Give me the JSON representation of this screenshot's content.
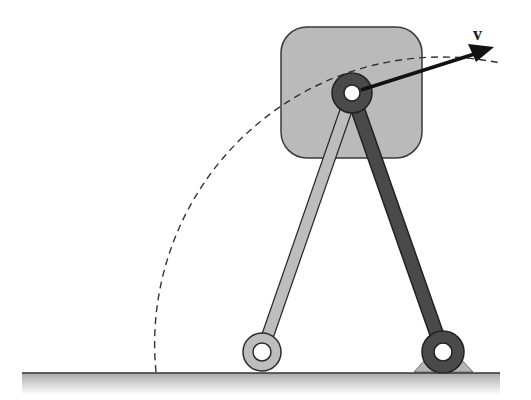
{
  "diagram": {
    "type": "four-bar linkage with coupler block",
    "labels": {
      "velocity": "v"
    },
    "colors": {
      "block_fill": "#b8b8b8",
      "block_stroke": "#3a3a3a",
      "light_link_fill": "#bdbdbd",
      "dark_link_fill": "#4a4a4a",
      "outline": "#2a2a2a",
      "ground_line": "#333333",
      "ground_shade_top": "#b0b0b0",
      "ground_shade_bottom": "#ffffff",
      "support_fill": "#b5b5b5",
      "dashed_path": "#333333",
      "arrow": "#111111"
    },
    "elements": {
      "block": {
        "x": 281,
        "y": 27,
        "width": 141,
        "height": 131,
        "corner_radius": 26
      },
      "top_joint": {
        "cx": 352,
        "cy": 93,
        "r_outer": 20,
        "r_hole": 8
      },
      "left_pivot": {
        "cx": 262,
        "cy": 352,
        "r_outer": 19,
        "r_hole": 9
      },
      "right_pivot": {
        "cx": 443,
        "cy": 352,
        "r_outer": 21,
        "r_hole": 9
      },
      "ground": {
        "x1": 22,
        "x2": 500,
        "y": 373
      },
      "velocity_arrow": {
        "x1": 360,
        "y1": 91,
        "x2": 492,
        "y2": 48
      },
      "dashed_arc": {
        "start": [
          156,
          372
        ],
        "end": [
          500,
          63
        ]
      }
    }
  }
}
